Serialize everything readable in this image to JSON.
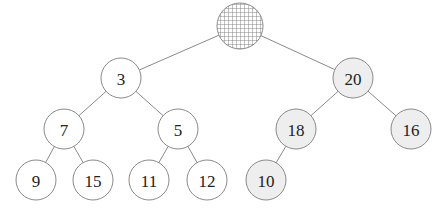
{
  "diagram": {
    "type": "binary-tree",
    "colors": {
      "edge": "#8a8a8a",
      "node_stroke": "#8a8a8a",
      "node_fill_default": "#ffffff",
      "node_fill_highlight": "#eeeeee",
      "root_pattern": "grid-hatch"
    },
    "nodes": [
      {
        "id": "root",
        "label": "",
        "x": 240,
        "y": 26,
        "r": 23,
        "style": "hatched"
      },
      {
        "id": "n3",
        "label": "3",
        "x": 121,
        "y": 78,
        "r": 20,
        "style": "default"
      },
      {
        "id": "n20",
        "label": "20",
        "x": 353,
        "y": 78,
        "r": 20,
        "style": "highlight"
      },
      {
        "id": "n7",
        "label": "7",
        "x": 64,
        "y": 129,
        "r": 20,
        "style": "default"
      },
      {
        "id": "n5",
        "label": "5",
        "x": 178,
        "y": 129,
        "r": 20,
        "style": "default"
      },
      {
        "id": "n18",
        "label": "18",
        "x": 296,
        "y": 129,
        "r": 20,
        "style": "highlight"
      },
      {
        "id": "n16",
        "label": "16",
        "x": 411,
        "y": 129,
        "r": 20,
        "style": "highlight"
      },
      {
        "id": "n9",
        "label": "9",
        "x": 36,
        "y": 180,
        "r": 20,
        "style": "default"
      },
      {
        "id": "n15",
        "label": "15",
        "x": 93,
        "y": 180,
        "r": 20,
        "style": "default"
      },
      {
        "id": "n11",
        "label": "11",
        "x": 149,
        "y": 180,
        "r": 20,
        "style": "default"
      },
      {
        "id": "n12",
        "label": "12",
        "x": 207,
        "y": 180,
        "r": 20,
        "style": "default"
      },
      {
        "id": "n10",
        "label": "10",
        "x": 266,
        "y": 180,
        "r": 20,
        "style": "highlight"
      }
    ],
    "edges": [
      [
        "root",
        "n3"
      ],
      [
        "root",
        "n20"
      ],
      [
        "n3",
        "n7"
      ],
      [
        "n3",
        "n5"
      ],
      [
        "n20",
        "n18"
      ],
      [
        "n20",
        "n16"
      ],
      [
        "n7",
        "n9"
      ],
      [
        "n7",
        "n15"
      ],
      [
        "n5",
        "n11"
      ],
      [
        "n5",
        "n12"
      ],
      [
        "n18",
        "n10"
      ]
    ]
  }
}
